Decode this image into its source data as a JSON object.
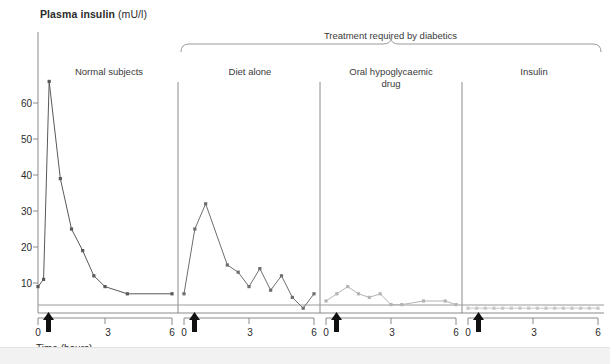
{
  "chart_data": {
    "type": "line",
    "title": "Plasma insulin (mU/l)",
    "title_bold": "Plasma insulin",
    "title_unit": "(mU/l)",
    "ylabel": "Plasma insulin (mU/l)",
    "xlabel": "Time (hours)",
    "ylim": [
      0,
      68
    ],
    "xlim": [
      0,
      6
    ],
    "yticks": [
      10,
      20,
      30,
      40,
      50,
      60
    ],
    "xticks": [
      0,
      3,
      6
    ],
    "xtick_labels": [
      "0",
      "3",
      "6"
    ],
    "grid": false,
    "legend": "none",
    "group_bracket_label": "Treatment required by diabetics",
    "meal_arrow_time_hours": 0.35,
    "baseline_reference_value": 2.0,
    "panels": [
      {
        "name": "normal-subjects",
        "label": "Normal subjects",
        "color": "#595959",
        "x": [
          0.0,
          0.25,
          0.5,
          1.0,
          1.5,
          2.0,
          2.5,
          3.0,
          4.0,
          6.0
        ],
        "y": [
          9,
          11,
          66,
          39,
          25,
          19,
          12,
          9,
          7,
          7
        ]
      },
      {
        "name": "diet-alone",
        "label": "Diet alone",
        "color": "#6e6e6e",
        "x": [
          0.0,
          0.5,
          1.0,
          2.0,
          2.5,
          3.0,
          3.5,
          4.0,
          4.5,
          5.0,
          5.5,
          6.0
        ],
        "y": [
          7,
          25,
          32,
          15,
          13,
          9,
          14,
          8,
          12,
          6,
          3,
          7
        ]
      },
      {
        "name": "oral-hypoglycaemic-drug",
        "label": "Oral hypoglycaemic drug",
        "label_line1": "Oral hypoglycaemic",
        "label_line2": "drug",
        "color": "#b4b4b4",
        "x": [
          0.0,
          0.5,
          1.0,
          1.5,
          2.0,
          2.5,
          3.0,
          3.5,
          4.5,
          5.5,
          6.0
        ],
        "y": [
          5,
          7,
          9,
          7,
          6,
          7,
          4,
          4,
          5,
          5,
          4
        ]
      },
      {
        "name": "insulin",
        "label": "Insulin",
        "color": "#c8c8c8",
        "x": [
          0.0,
          0.4,
          0.8,
          1.2,
          1.6,
          2.0,
          2.4,
          2.8,
          3.2,
          3.6,
          4.0,
          4.4,
          4.8,
          5.2,
          5.6,
          6.0
        ],
        "y": [
          3,
          3,
          3,
          3,
          3,
          3,
          3,
          3,
          3,
          3,
          3,
          3,
          3,
          3,
          3,
          3
        ]
      }
    ]
  },
  "axis": {
    "x_caption": "Time (hours)",
    "y_tick_0": "10",
    "y_tick_1": "20",
    "y_tick_2": "30",
    "y_tick_3": "40",
    "y_tick_4": "50",
    "y_tick_5": "60"
  },
  "panel_x_labels": {
    "p0_left": "0",
    "p0_mid": "3",
    "p0_right": "6",
    "p1_left": "0",
    "p1_mid": "3",
    "p1_right": "6",
    "p2_left": "0",
    "p2_mid": "3",
    "p2_right": "6",
    "p3_left": "0",
    "p3_mid": "3",
    "p3_right": "6"
  },
  "colors": {
    "ink": "#2b2b2b",
    "axis": "#8a8a8a",
    "series_normal": "#595959",
    "series_diet": "#6e6e6e",
    "series_oral": "#b4b4b4",
    "series_insulin": "#c8c8c8",
    "footer": "#f2f2f2"
  }
}
